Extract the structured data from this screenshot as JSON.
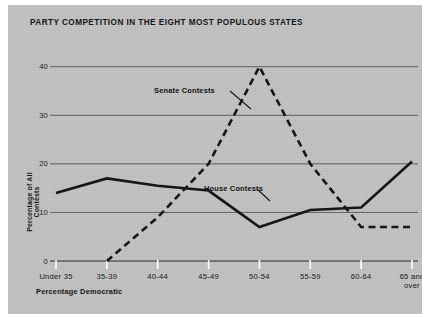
{
  "figure": {
    "title": "PARTY COMPETITION IN THE EIGHT MOST POPULOUS STATES",
    "background_color": "#c3c3c3",
    "ink_color": "#15161a",
    "page_color": "#ffffff"
  },
  "annotations": {
    "senate_label": "Senate Contests",
    "house_label": "House Contests"
  },
  "chart_data": {
    "type": "line",
    "title": "PARTY COMPETITION IN THE EIGHT MOST POPULOUS STATES",
    "xlabel": "Percentage Democratic",
    "ylabel": "Percentage of All Contests",
    "categories": [
      "Under 35",
      "35-39",
      "40-44",
      "45-49",
      "50-54",
      "55-59",
      "60-64",
      "65 and\nover"
    ],
    "category_labels_flat": [
      "Under 35",
      "35-39",
      "40-44",
      "45-49",
      "50-54",
      "55-59",
      "60-64",
      "65 and over"
    ],
    "ylim": [
      0,
      42
    ],
    "yticks": [
      0,
      10,
      20,
      30,
      40
    ],
    "ytick_labels": [
      "0",
      "10",
      "20",
      "30",
      "40"
    ],
    "grid": "horizontal",
    "legend": "inline-annotations",
    "series": [
      {
        "name": "House Contests",
        "style": "solid",
        "color": "#15161a",
        "values": [
          14,
          17,
          15.5,
          14.5,
          7,
          10.5,
          11,
          20.5
        ]
      },
      {
        "name": "Senate Contests",
        "style": "dashed",
        "color": "#15161a",
        "values": [
          null,
          0,
          9,
          20,
          40,
          20,
          7,
          7
        ]
      }
    ]
  }
}
